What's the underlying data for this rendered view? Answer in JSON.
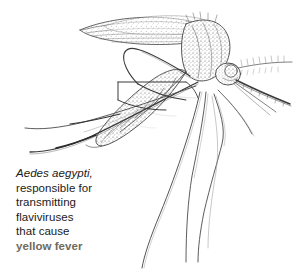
{
  "figure": {
    "illustration_style": "stippled line engraving",
    "ink_color": "#3a3a3a",
    "background_color": "#ffffff",
    "parts": [
      "wing",
      "thorax",
      "abdomen",
      "head",
      "compound-eye",
      "proboscis",
      "antenna",
      "legs"
    ]
  },
  "caption": {
    "species": "Aedes aegypti,",
    "line2": "responsible for",
    "line3": "transmitting",
    "line4": "flaviviruses",
    "line5": "that cause",
    "highlight": "yellow fever",
    "highlight_color": "#6e6a5c",
    "text_color": "#1a1a1a"
  }
}
